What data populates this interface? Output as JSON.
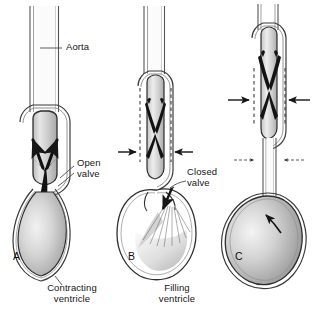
{
  "figure": {
    "background_color": "#ffffff",
    "ink_color": "#1a1a1a",
    "tissue_fill": "#d8d8d8"
  },
  "annotations": {
    "aorta_label": "Aorta",
    "open_valve_label": "Open\nvalve",
    "closed_valve_label": "Closed\nvalve"
  },
  "panels": [
    {
      "letter": "A",
      "caption": "Contracting\nventricle",
      "valve_state": "open",
      "ventricle_state": "contracting",
      "flow_direction": "outward-upward",
      "sinus_arrows": "two diverging ejection arrows",
      "wall_arrows": "none"
    },
    {
      "letter": "B",
      "caption": "Filling\nventricle",
      "valve_state": "closed",
      "ventricle_state": "filling",
      "flow_direction": "inward-downward",
      "sinus_arrows": "crossed closed-cusp arrows",
      "wall_arrows": "two inward solid arrows"
    },
    {
      "letter": "C",
      "caption": "",
      "valve_state": "closed",
      "ventricle_state": "relaxed",
      "flow_direction": "upward",
      "sinus_arrows": "crossed closed-cusp arrows",
      "wall_arrows": "two inward solid arrows and two inward dashed arrows"
    }
  ]
}
